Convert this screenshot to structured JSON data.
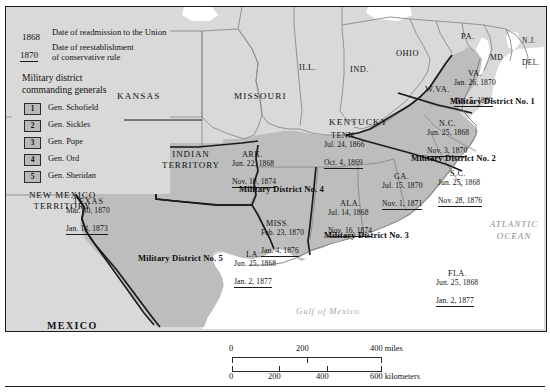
{
  "legend": {
    "readmission": {
      "year": "1868",
      "text": "Date of readmission to the Union"
    },
    "conservative": {
      "year": "1870",
      "text_line1": "Date of reestablishment",
      "text_line2": "of conservative rule"
    },
    "generals_heading_line1": "Military district",
    "generals_heading_line2": "commanding generals",
    "generals": [
      {
        "number": "1",
        "name": "Gen. Schofield"
      },
      {
        "number": "2",
        "name": "Gen. Sickles"
      },
      {
        "number": "3",
        "name": "Gen. Pope"
      },
      {
        "number": "4",
        "name": "Gen. Ord"
      },
      {
        "number": "5",
        "name": "Gen. Sheridan"
      }
    ]
  },
  "districts": [
    {
      "id": "d1",
      "label": "Military District No. 1"
    },
    {
      "id": "d2",
      "label": "Military District No. 2"
    },
    {
      "id": "d3",
      "label": "Military District No. 3"
    },
    {
      "id": "d4",
      "label": "Military District No. 4"
    },
    {
      "id": "d5",
      "label": "Military District No. 5"
    }
  ],
  "confederate_states": [
    {
      "abbr": "VA.",
      "readmitted": "Jan. 26, 1870",
      "conservative": "Oct. 5, 1869"
    },
    {
      "abbr": "N.C.",
      "readmitted": "Jun. 25, 1868",
      "conservative": "Nov. 3, 1870"
    },
    {
      "abbr": "S.C.",
      "readmitted": "Jun. 25, 1868",
      "conservative": "Nov. 28, 1876"
    },
    {
      "abbr": "GA.",
      "readmitted": "Jul. 15, 1870",
      "conservative": "Nov. 1, 1871"
    },
    {
      "abbr": "FLA.",
      "readmitted": "Jun. 25, 1868",
      "conservative": "Jan. 2, 1877"
    },
    {
      "abbr": "ALA.",
      "readmitted": "Jul. 14, 1868",
      "conservative": "Nov. 16, 1874"
    },
    {
      "abbr": "MISS.",
      "readmitted": "Feb. 23, 1870",
      "conservative": "Jan. 4, 1876"
    },
    {
      "abbr": "LA.",
      "readmitted": "Jun. 25, 1868",
      "conservative": "Jan. 2, 1877"
    },
    {
      "abbr": "ARK.",
      "readmitted": "Jun. 22, 1868",
      "conservative": "Nov. 10, 1874"
    },
    {
      "abbr": "TENN.",
      "readmitted": "Jul. 24, 1866",
      "conservative": "Oct. 4, 1869"
    },
    {
      "abbr": "TEXAS",
      "readmitted": "Mar. 30, 1870",
      "conservative": "Jan. 14, 1873"
    }
  ],
  "other_places": {
    "kansas": "KANSAS",
    "missouri": "MISSOURI",
    "kentucky": "KENTUCKY",
    "illinois": "ILL.",
    "indiana": "IND.",
    "ohio": "OHIO",
    "west_virginia": "W.VA.",
    "pennsylvania": "PA.",
    "new_jersey": "N.J.",
    "maryland": "MD",
    "delaware": "DEL.",
    "indian_territory_line1": "INDIAN",
    "indian_territory_line2": "TERRITORY",
    "new_mexico_line1": "NEW MEXICO",
    "new_mexico_line2": "TERRITORY",
    "mexico": "MEXICO",
    "atlantic_line1": "ATLANTIC",
    "atlantic_line2": "OCEAN",
    "gulf": "Gulf of Mexico"
  },
  "scale": {
    "miles_ticks": [
      "0",
      "200",
      "400 miles"
    ],
    "km_ticks": [
      "0",
      "200",
      "400",
      "600 kilometers"
    ]
  },
  "colors": {
    "background": "#d9d9d9",
    "confederate_fill": "#bdbdbd",
    "water": "#ffffff",
    "border": "#1b1b1b"
  }
}
